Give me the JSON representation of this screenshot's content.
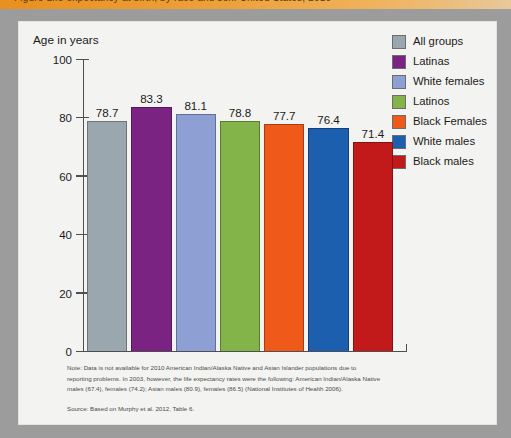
{
  "header": {
    "band_text": "Figure  Life expectancy at birth, by race and sex: United States, 2010",
    "band_color": "#e8901f"
  },
  "frame": {
    "outer_color": "#9c9c9c",
    "inner_color": "#f3f3f1"
  },
  "axis": {
    "title": "Age in years",
    "ticks": [
      "100",
      "80",
      "60",
      "40",
      "20",
      "0"
    ]
  },
  "legend": [
    {
      "label": "All groups",
      "color": "#9aa7ae"
    },
    {
      "label": "Latinas",
      "color": "#7b2382"
    },
    {
      "label": "White females",
      "color": "#8e9fd4"
    },
    {
      "label": "Latinos",
      "color": "#82b44a"
    },
    {
      "label": "Black Females",
      "color": "#ef5a1a"
    },
    {
      "label": "White males",
      "color": "#1c5fae"
    },
    {
      "label": "Black males",
      "color": "#c21a1a"
    }
  ],
  "notes": {
    "line1": "Note: Data is not available for 2010 American Indian/Alaska Native and Asian Islander populations due to",
    "line2": "reporting problems. In 2003, however, the life expectancy rates were the following: American Indian/Alaska Native",
    "line3": "males (67.4), females (74.2); Asian males (80.9), females (86.5) (National Institutes of Health 2006).",
    "source": "Source: Based on Murphy et al. 2012, Table 6."
  },
  "chart_data": {
    "type": "bar",
    "title": "Age in years",
    "xlabel": "",
    "ylabel": "Age in years",
    "ylim": [
      0,
      100
    ],
    "yticks": [
      0,
      20,
      40,
      60,
      80,
      100
    ],
    "grid": false,
    "legend_position": "right",
    "categories": [
      "All groups",
      "Latinas",
      "White females",
      "Latinos",
      "Black Females",
      "White males",
      "Black males"
    ],
    "values": [
      78.7,
      83.3,
      81.1,
      78.8,
      77.7,
      76.4,
      71.4
    ],
    "value_labels": [
      "78.7",
      "83.3",
      "81.1",
      "78.8",
      "77.7",
      "76.4",
      "71.4"
    ],
    "colors": [
      "#9aa7ae",
      "#7b2382",
      "#8e9fd4",
      "#82b44a",
      "#ef5a1a",
      "#1c5fae",
      "#c21a1a"
    ]
  }
}
